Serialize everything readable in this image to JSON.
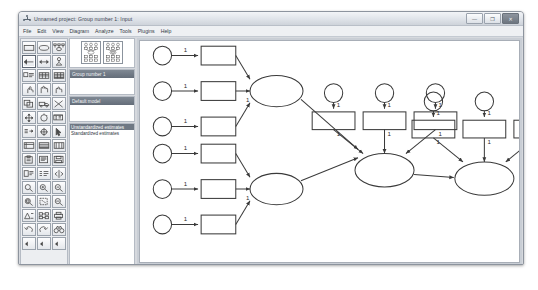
{
  "window": {
    "title": "Unnamed project: Group number 1: Input",
    "app_icon": "amos-path-diagram-icon",
    "controls": {
      "minimize": "—",
      "maximize": "❐",
      "close": "✕"
    }
  },
  "menubar": {
    "items": [
      {
        "label": "File"
      },
      {
        "label": "Edit"
      },
      {
        "label": "View"
      },
      {
        "label": "Diagram"
      },
      {
        "label": "Analyze"
      },
      {
        "label": "Tools"
      },
      {
        "label": "Plugins"
      },
      {
        "label": "Help"
      }
    ]
  },
  "toolbar": {
    "tools": [
      {
        "name": "draw-observed-variable-icon",
        "glyph": "rect"
      },
      {
        "name": "draw-unobserved-variable-icon",
        "glyph": "ellipse"
      },
      {
        "name": "draw-latent-with-indicators-icon",
        "glyph": "indicators"
      },
      {
        "name": "draw-path-icon",
        "glyph": "arrow-left"
      },
      {
        "name": "draw-covariance-icon",
        "glyph": "arrow-both"
      },
      {
        "name": "add-unique-variable-icon",
        "glyph": "unique"
      },
      {
        "name": "figure-caption-icon",
        "glyph": "caption"
      },
      {
        "name": "list-variables-in-model-icon",
        "glyph": "grid-a"
      },
      {
        "name": "list-variables-in-dataset-icon",
        "glyph": "grid-b"
      },
      {
        "name": "select-one-object-icon",
        "glyph": "hand-point"
      },
      {
        "name": "select-all-objects-icon",
        "glyph": "hand-all"
      },
      {
        "name": "deselect-all-objects-icon",
        "glyph": "hand-none"
      },
      {
        "name": "duplicate-objects-icon",
        "glyph": "copy"
      },
      {
        "name": "move-objects-icon",
        "glyph": "truck"
      },
      {
        "name": "erase-objects-icon",
        "glyph": "eraser-x"
      },
      {
        "name": "change-shape-icon",
        "glyph": "resize"
      },
      {
        "name": "rotate-indicators-icon",
        "glyph": "rotate"
      },
      {
        "name": "reflect-indicators-icon",
        "glyph": "reflect"
      },
      {
        "name": "move-parameter-values-icon",
        "glyph": "move-param"
      },
      {
        "name": "reposition-path-diagram-icon",
        "glyph": "reposition"
      },
      {
        "name": "touch-up-variable-icon",
        "glyph": "pointer"
      },
      {
        "name": "select-data-file-icon",
        "glyph": "grid-c"
      },
      {
        "name": "analysis-properties-icon",
        "glyph": "grid-d"
      },
      {
        "name": "calculate-estimates-icon",
        "glyph": "grid-e"
      },
      {
        "name": "clipboard-copy-icon",
        "glyph": "clipboard"
      },
      {
        "name": "view-text-output-icon",
        "glyph": "text-out"
      },
      {
        "name": "save-diagram-icon",
        "glyph": "save"
      },
      {
        "name": "object-properties-icon",
        "glyph": "obj-props"
      },
      {
        "name": "drag-properties-icon",
        "glyph": "drag-props"
      },
      {
        "name": "preserve-symmetries-icon",
        "glyph": "symmetry"
      },
      {
        "name": "zoom-select-icon",
        "glyph": "zoom"
      },
      {
        "name": "zoom-in-icon",
        "glyph": "zoom-in"
      },
      {
        "name": "zoom-out-icon",
        "glyph": "zoom-out"
      },
      {
        "name": "zoom-page-icon",
        "glyph": "zoom-page"
      },
      {
        "name": "fit-to-page-icon",
        "glyph": "fit-page"
      },
      {
        "name": "loupe-icon",
        "glyph": "loupe"
      },
      {
        "name": "bayesian-estimation-icon",
        "glyph": "bayes"
      },
      {
        "name": "multiple-group-analysis-icon",
        "glyph": "multigroup"
      },
      {
        "name": "print-icon",
        "glyph": "printer"
      },
      {
        "name": "undo-icon",
        "glyph": "undo"
      },
      {
        "name": "redo-icon",
        "glyph": "redo"
      },
      {
        "name": "specification-search-icon",
        "glyph": "binoculars"
      },
      {
        "name": "scroll-left-icon",
        "glyph": "tri-left"
      },
      {
        "name": "scroll-left-2-icon",
        "glyph": "tri-left"
      },
      {
        "name": "scroll-left-3-icon",
        "glyph": "tri-left"
      }
    ]
  },
  "panels": {
    "model_views": {
      "thumb_a": "input-path-diagram-thumbnail",
      "thumb_b": "output-path-diagram-thumbnail"
    },
    "groups": {
      "header": "Group number 1",
      "items": []
    },
    "models": {
      "header": "Default model",
      "items": []
    },
    "estimates": {
      "header": "Unstandardized estimates",
      "items": [
        {
          "label": "Unstandardized estimates",
          "selected": true
        },
        {
          "label": "Standardized estimates",
          "selected": false
        }
      ]
    }
  },
  "diagram": {
    "name": "sem-path-diagram",
    "fixed_loading_label": "1",
    "blocks": [
      {
        "name": "exogenous-factor-1",
        "indicators": 3,
        "errors": 3,
        "position": "upper-left"
      },
      {
        "name": "exogenous-factor-2",
        "indicators": 3,
        "errors": 3,
        "position": "lower-left"
      },
      {
        "name": "mediator-factor",
        "indicators": 3,
        "errors": 3,
        "position": "center"
      },
      {
        "name": "outcome-factor",
        "indicators": 3,
        "errors": 3,
        "position": "right"
      }
    ]
  },
  "colors": {
    "stroke": "#3a3a3a",
    "canvas_bg": "#ffffff",
    "panel_header": "#6a737f",
    "selection": "#6f7884"
  }
}
